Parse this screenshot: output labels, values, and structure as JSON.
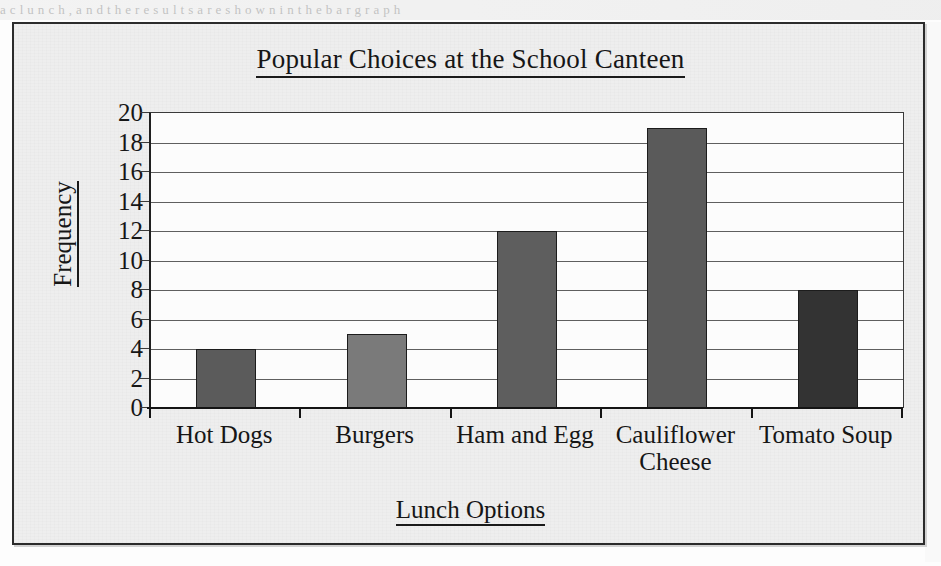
{
  "page": {
    "scan_bleed_text": "a  c  l  u  n  c  h  ,     a  n  d     t  h  e     r  e  s  u  l  t  s     a  r  e     s  h  o  w  n     i  n     t  h  e     b  a  r     g  r  a  p  h"
  },
  "chart_data": {
    "type": "bar",
    "title": "Popular Choices at the School Canteen",
    "xlabel": "Lunch Options",
    "ylabel": "Frequency",
    "categories": [
      "Hot Dogs",
      "Burgers",
      "Ham and Egg",
      "Cauliflower Cheese",
      "Tomato Soup"
    ],
    "values": [
      4,
      5,
      12,
      19,
      8
    ],
    "ylim": [
      0,
      20
    ],
    "ytick_step": 2,
    "yticks": [
      "20",
      "18",
      "16",
      "14",
      "12",
      "10",
      "8",
      "6",
      "4",
      "2",
      "0"
    ],
    "grid": true,
    "legend": "none",
    "bar_colors": [
      "#5b5b5b",
      "#7a7a7a",
      "#5e5e5e",
      "#5a5a5a",
      "#333333"
    ],
    "frame_color": "#2b2b2b",
    "axis_color": "#141414",
    "gridline_color": "#5f5f5f",
    "plot_background": "#fcfcfc",
    "figure_background": "#eeeeee"
  }
}
